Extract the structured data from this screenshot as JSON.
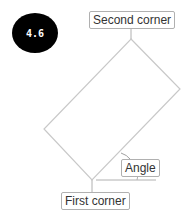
{
  "badge": {
    "value": "4.6",
    "color": "#000000"
  },
  "labels": {
    "second_corner": "Second corner",
    "angle": "Angle",
    "first_corner": "First corner"
  },
  "colors": {
    "line": "#c8c8c8",
    "label_border": "#b0b0b0",
    "text": "#333333"
  }
}
